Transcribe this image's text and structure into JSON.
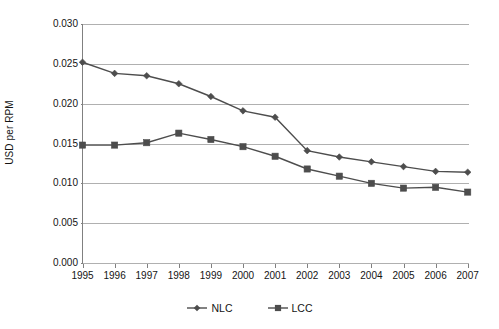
{
  "chart_data": {
    "type": "line",
    "title": "",
    "subtitle": "",
    "xlabel": "",
    "ylabel": "USD per RPM",
    "categories": [
      "1995",
      "1996",
      "1997",
      "1998",
      "1999",
      "2000",
      "2001",
      "2002",
      "2003",
      "2004",
      "2005",
      "2006",
      "2007"
    ],
    "x": [
      1995,
      1996,
      1997,
      1998,
      1999,
      2000,
      2001,
      2002,
      2003,
      2004,
      2005,
      2006,
      2007
    ],
    "series": [
      {
        "name": "NLC",
        "marker": "diamond",
        "color": "#4d4d4d",
        "values": [
          0.0252,
          0.0238,
          0.0235,
          0.0225,
          0.0209,
          0.0191,
          0.0183,
          0.0141,
          0.0133,
          0.0127,
          0.0121,
          0.0115,
          0.0114
        ]
      },
      {
        "name": "LCC",
        "marker": "square",
        "color": "#4d4d4d",
        "values": [
          0.0148,
          0.0148,
          0.0151,
          0.0163,
          0.0155,
          0.0146,
          0.0134,
          0.0118,
          0.0109,
          0.01,
          0.0094,
          0.0095,
          0.0089
        ]
      }
    ],
    "ylim": [
      0.0,
      0.03
    ],
    "yticks": [
      0.0,
      0.005,
      0.01,
      0.015,
      0.02,
      0.025,
      0.03
    ],
    "ytick_labels": [
      "0.000",
      "0.005",
      "0.010",
      "0.015",
      "0.020",
      "0.025",
      "0.030"
    ],
    "grid": true,
    "grid_axis": "y",
    "legend_position": "bottom-center",
    "legend_entries": [
      "NLC",
      "LCC"
    ]
  },
  "axes": {
    "y_title": "USD per RPM",
    "axis_color": "#808080",
    "gridline_color": "#b0b0b0",
    "tick_label_color": "#141414"
  },
  "legend": {
    "items": [
      {
        "label": "NLC",
        "marker": "diamond-marker-icon"
      },
      {
        "label": "LCC",
        "marker": "square-marker-icon"
      }
    ]
  }
}
